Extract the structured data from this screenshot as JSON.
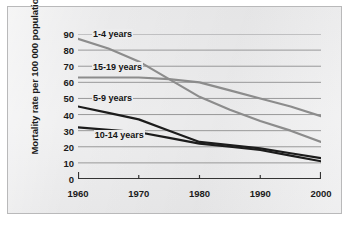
{
  "figure": {
    "background_color": "#ececed",
    "border_color": "#b9b9ba",
    "axis_color": "#333333",
    "gridline_color": "#8e8e90"
  },
  "chart_data": {
    "type": "line",
    "title": "",
    "subtitle": "",
    "xlabel": "",
    "ylabel": "Mortality rate per 100 000 population",
    "x": [
      1960,
      1965,
      1970,
      1975,
      1980,
      1985,
      1990,
      1995,
      2000
    ],
    "xlim": [
      1960,
      2000
    ],
    "ylim": [
      0,
      90
    ],
    "xticks": [
      1960,
      1970,
      1980,
      1990,
      2000
    ],
    "yticks": [
      0,
      10,
      20,
      30,
      40,
      50,
      60,
      70,
      80,
      90
    ],
    "xtick_labels": [
      "1960",
      "1970",
      "1980",
      "1990",
      "2000"
    ],
    "ytick_labels": [
      "0",
      "10",
      "20",
      "30",
      "40",
      "50",
      "60",
      "70",
      "80",
      "90"
    ],
    "grid": "horizontal",
    "legend": "inline-labels",
    "series": [
      {
        "name": "1-4 years",
        "color": "#8c8c8c",
        "width": 2.2,
        "values": [
          87,
          81,
          73,
          62,
          51,
          43,
          36,
          30,
          23
        ]
      },
      {
        "name": "15-19 years",
        "color": "#8c8c8c",
        "width": 2.2,
        "values": [
          63,
          63,
          63,
          62,
          60,
          55,
          50,
          45,
          39
        ]
      },
      {
        "name": "5-9 years",
        "color": "#1c1c1c",
        "width": 2.2,
        "values": [
          45,
          41,
          37,
          30,
          23,
          21,
          19,
          16,
          13
        ]
      },
      {
        "name": "10-14 years",
        "color": "#1c1c1c",
        "width": 2.2,
        "values": [
          32,
          30.5,
          29,
          25.5,
          22,
          20,
          18,
          14.5,
          11
        ]
      }
    ],
    "annotations": [
      {
        "text": "1-4 years",
        "x": 1962.3,
        "y": 90
      },
      {
        "text": "15-19 years",
        "x": 1962.3,
        "y": 69.5
      },
      {
        "text": "5-9 years",
        "x": 1962.3,
        "y": 50
      },
      {
        "text": "10-14 years",
        "x": 1962.6,
        "y": 27.5
      }
    ]
  }
}
